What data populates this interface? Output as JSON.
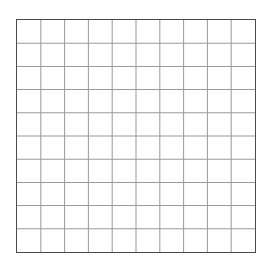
{
  "grid": {
    "columns": 10,
    "rows": 10,
    "border_color": "#4a4a4a",
    "line_color": "#9a9a9a",
    "background_color": "#ffffff"
  }
}
